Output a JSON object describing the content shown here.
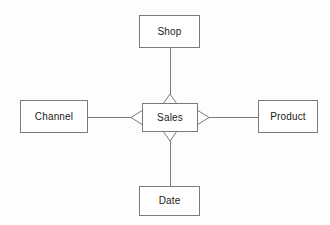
{
  "diagram": {
    "type": "star-schema-er-diagram",
    "background_color": "#fdfdfd",
    "line_color": "#7a7a7a",
    "text_color": "#1b1b1b",
    "fact_table": {
      "label": "Sales",
      "x": 142,
      "y": 103,
      "width": 56,
      "height": 29
    },
    "dimensions": [
      {
        "id": "shop",
        "label": "Shop",
        "position": "top",
        "x": 139,
        "y": 15,
        "width": 61,
        "height": 33,
        "connector_marker": "open-triangle-up"
      },
      {
        "id": "channel",
        "label": "Channel",
        "position": "left",
        "x": 20,
        "y": 100,
        "width": 68,
        "height": 33,
        "connector_marker": "open-triangle-left"
      },
      {
        "id": "product",
        "label": "Product",
        "position": "right",
        "x": 258,
        "y": 100,
        "width": 60,
        "height": 33,
        "connector_marker": "open-triangle-right"
      },
      {
        "id": "date",
        "label": "Date",
        "position": "bottom",
        "x": 139,
        "y": 186,
        "width": 61,
        "height": 30,
        "connector_marker": "open-triangle-down"
      }
    ],
    "relationships": [
      {
        "from": "Sales",
        "to": "Shop",
        "orientation": "vertical"
      },
      {
        "from": "Sales",
        "to": "Channel",
        "orientation": "horizontal"
      },
      {
        "from": "Sales",
        "to": "Product",
        "orientation": "horizontal"
      },
      {
        "from": "Sales",
        "to": "Date",
        "orientation": "vertical"
      }
    ]
  }
}
